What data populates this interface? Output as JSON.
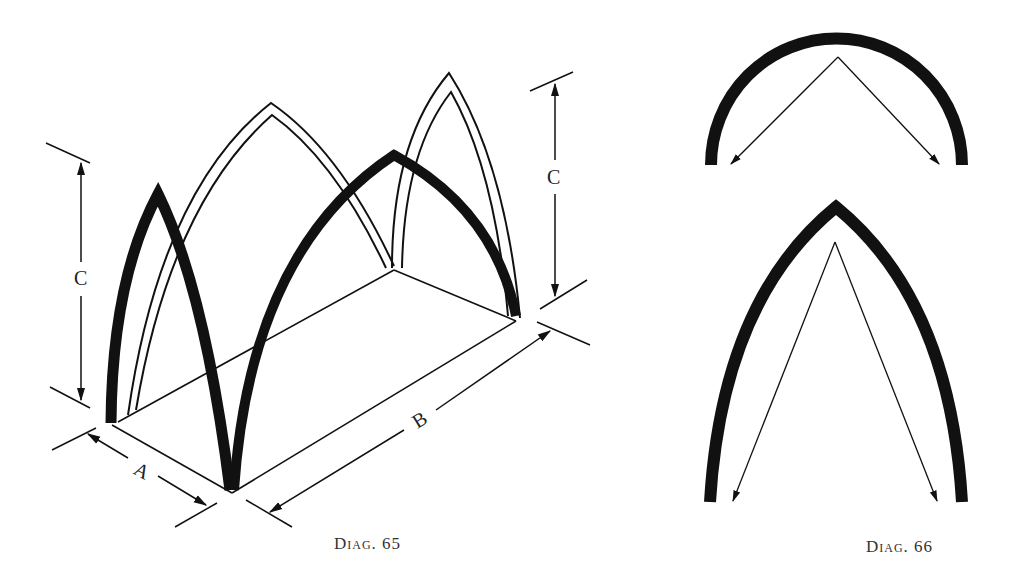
{
  "figures": [
    {
      "id": "diag65",
      "caption": "Diag. 65",
      "description": "Isometric view of a rectangular bay with pointed Gothic arches",
      "dimension_labels": {
        "width": "A",
        "length": "B",
        "height_left": "C",
        "height_right": "C"
      }
    },
    {
      "id": "diag66",
      "caption": "Diag. 66",
      "description": "Comparison of thrust directions in a semicircular arch (top) and a pointed arch (bottom)",
      "parts": [
        "semicircular-arch",
        "pointed-arch"
      ]
    }
  ],
  "colors": {
    "ink": "#111111",
    "background": "#ffffff"
  }
}
